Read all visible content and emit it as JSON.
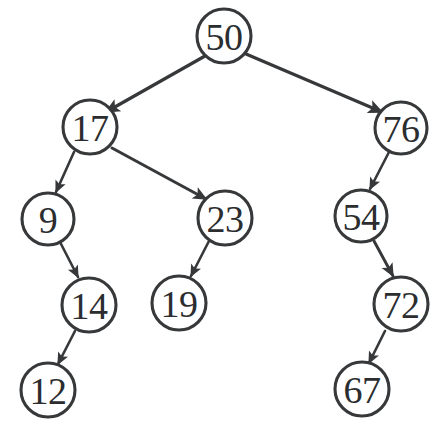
{
  "figure": {
    "kind": "binary-search-tree-diagram",
    "background_color": "#ffffff",
    "ink_color": "#36383a",
    "label_color": "#2b2d2f",
    "width": 442,
    "height": 437,
    "cropped_caption_fragment": "partial line of text cropped at bottom edge"
  },
  "chart_data": {
    "type": "diagram",
    "title": "",
    "root": "50",
    "nodes": [
      {
        "id": "n50",
        "label": "50",
        "cx": 224,
        "cy": 36,
        "r": 27,
        "depth": 0,
        "side": "root"
      },
      {
        "id": "n17",
        "label": "17",
        "cx": 90,
        "cy": 127,
        "r": 27,
        "depth": 1,
        "side": "left"
      },
      {
        "id": "n76",
        "label": "76",
        "cx": 401,
        "cy": 128,
        "r": 26,
        "depth": 1,
        "side": "right"
      },
      {
        "id": "n9",
        "label": "9",
        "cx": 48,
        "cy": 219,
        "r": 26,
        "depth": 2,
        "side": "left"
      },
      {
        "id": "n23",
        "label": "23",
        "cx": 225,
        "cy": 218,
        "r": 27,
        "depth": 2,
        "side": "right"
      },
      {
        "id": "n54",
        "label": "54",
        "cx": 361,
        "cy": 216,
        "r": 26,
        "depth": 2,
        "side": "left"
      },
      {
        "id": "n14",
        "label": "14",
        "cx": 89,
        "cy": 305,
        "r": 27,
        "depth": 3,
        "side": "right"
      },
      {
        "id": "n19",
        "label": "19",
        "cx": 179,
        "cy": 303,
        "r": 27,
        "depth": 3,
        "side": "left"
      },
      {
        "id": "n72",
        "label": "72",
        "cx": 401,
        "cy": 304,
        "r": 27,
        "depth": 3,
        "side": "right"
      },
      {
        "id": "n12",
        "label": "12",
        "cx": 48,
        "cy": 390,
        "r": 27,
        "depth": 4,
        "side": "left"
      },
      {
        "id": "n67",
        "label": "67",
        "cx": 362,
        "cy": 389,
        "r": 27,
        "depth": 4,
        "side": "left"
      }
    ],
    "edges": [
      {
        "from": "n50",
        "to": "n17",
        "label": "left",
        "x1": 205,
        "y1": 56,
        "x2": 106,
        "y2": 112,
        "width": 3.2,
        "head": 11
      },
      {
        "from": "n50",
        "to": "n76",
        "label": "right",
        "x1": 246,
        "y1": 54,
        "x2": 382,
        "y2": 112,
        "width": 3.2,
        "head": 11
      },
      {
        "from": "n17",
        "to": "n9",
        "label": "left",
        "x1": 74,
        "y1": 152,
        "x2": 56,
        "y2": 192,
        "width": 2.6,
        "head": 9
      },
      {
        "from": "n17",
        "to": "n23",
        "label": "right",
        "x1": 112,
        "y1": 148,
        "x2": 206,
        "y2": 199,
        "width": 3.0,
        "head": 10
      },
      {
        "from": "n76",
        "to": "n54",
        "label": "left",
        "x1": 389,
        "y1": 152,
        "x2": 370,
        "y2": 189,
        "width": 2.6,
        "head": 9
      },
      {
        "from": "n9",
        "to": "n14",
        "label": "right",
        "x1": 60,
        "y1": 242,
        "x2": 78,
        "y2": 277,
        "width": 2.6,
        "head": 9
      },
      {
        "from": "n23",
        "to": "n19",
        "label": "left",
        "x1": 209,
        "y1": 241,
        "x2": 191,
        "y2": 276,
        "width": 2.6,
        "head": 9
      },
      {
        "from": "n54",
        "to": "n72",
        "label": "right",
        "x1": 374,
        "y1": 241,
        "x2": 393,
        "y2": 276,
        "width": 2.9,
        "head": 10
      },
      {
        "from": "n14",
        "to": "n12",
        "label": "left",
        "x1": 75,
        "y1": 331,
        "x2": 58,
        "y2": 364,
        "width": 2.6,
        "head": 9
      },
      {
        "from": "n72",
        "to": "n67",
        "label": "left",
        "x1": 385,
        "y1": 331,
        "x2": 369,
        "y2": 363,
        "width": 2.6,
        "head": 9
      }
    ],
    "traversal_inorder": [
      "9",
      "12",
      "14",
      "17",
      "19",
      "23",
      "50",
      "54",
      "67",
      "72",
      "76"
    ],
    "values": [
      50,
      17,
      76,
      9,
      23,
      54,
      14,
      19,
      72,
      12,
      67
    ]
  }
}
